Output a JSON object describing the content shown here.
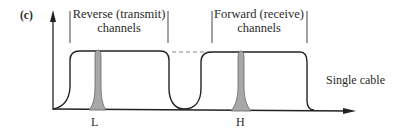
{
  "figure": {
    "panel_label": "(c)",
    "reverse_band": {
      "line1": "Reverse (transmit)",
      "line2": "channels"
    },
    "forward_band": {
      "line1": "Forward (receive)",
      "line2": "channels"
    },
    "medium_label": "Single cable",
    "low_marker": "L",
    "high_marker": "H",
    "colors": {
      "line": "#222222",
      "peak_fill": "#a8a8a8",
      "dashed": "#888888"
    }
  }
}
